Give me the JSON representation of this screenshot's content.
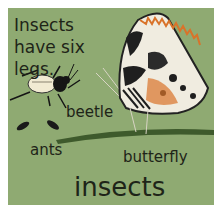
{
  "page": {
    "heading": "Insects have six legs.",
    "title": "insects",
    "labels": {
      "beetle": "beetle",
      "ants": "ants",
      "butterfly": "butterfly"
    },
    "colors": {
      "background": "#8faa72",
      "text": "#1e2418",
      "grass_stem": "#3e5a2c",
      "butterfly_orange": "#d9732a",
      "beetle_shell": "#f1ead2"
    }
  }
}
